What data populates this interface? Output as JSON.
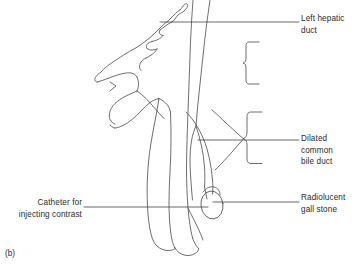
{
  "figure": {
    "label": "(b)",
    "type": "medical-line-diagram",
    "ink_color": "#4a4a4a",
    "text_color": "#2b2b2b",
    "background_color": "#ffffff"
  },
  "annotations": {
    "left_hepatic_duct": {
      "text": "Left hepatic\nduct",
      "side": "right"
    },
    "dilated_common_bile_duct": {
      "text": "Dilated\ncommon\nbile duct",
      "side": "right"
    },
    "radiolucent_gall_stone": {
      "text": "Radiolucent\ngall stone",
      "side": "right"
    },
    "catheter": {
      "text": "Catheter for\ninjecting contrast",
      "side": "left"
    }
  },
  "structures": [
    {
      "name": "left-hepatic-duct",
      "description": "branching intrahepatic duct outline, upper left"
    },
    {
      "name": "common-bile-duct",
      "description": "dilated vertical duct running down centre"
    },
    {
      "name": "cystic-duct",
      "description": "short duct joining common bile duct"
    },
    {
      "name": "gall-bladder",
      "description": "pear shaped sac upper left of duct"
    },
    {
      "name": "catheter",
      "description": "narrow tube entering from lower left along duct"
    },
    {
      "name": "gall-stone",
      "description": "rounded radiolucent filling defect at lower duct"
    },
    {
      "name": "bracket-upper",
      "description": "curly brace marking duct segment"
    },
    {
      "name": "bracket-lower",
      "description": "curly brace marking dilated segment"
    }
  ]
}
